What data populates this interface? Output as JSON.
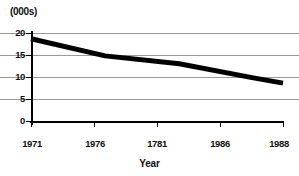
{
  "chart_data": {
    "type": "line",
    "title": "",
    "unit_label": "(000s)",
    "xlabel": "Year",
    "ylabel": "",
    "x_tick_labels": [
      "1971",
      "1976",
      "1781",
      "1986",
      "1988"
    ],
    "x_tick_values": [
      1971,
      1976,
      1981,
      1986,
      1988
    ],
    "y_tick_labels": [
      "0",
      "5",
      "10",
      "15",
      "20"
    ],
    "y_tick_values": [
      0,
      5,
      10,
      15,
      20
    ],
    "ylim": [
      0,
      20
    ],
    "xlim": [
      1971,
      1988
    ],
    "grid": "horizontal",
    "legend": "none",
    "series": [
      {
        "name": "value",
        "color": "#000000",
        "line_width_px": 5,
        "x": [
          1971,
          1976,
          1981,
          1986,
          1988
        ],
        "values": [
          18.7,
          14.8,
          13.0,
          9.8,
          8.6
        ]
      }
    ]
  },
  "axis": {
    "y_labels": [
      "20",
      "15",
      "10",
      "5",
      "0"
    ],
    "x_labels": [
      "1971",
      "1976",
      "1781",
      "1986",
      "1988"
    ],
    "x_title": "Year",
    "unit": "(000s)"
  },
  "colors": {
    "line": "#000000",
    "grid": "#9a9a9a",
    "axis": "#000000",
    "background": "#ffffff",
    "text": "#111111"
  }
}
